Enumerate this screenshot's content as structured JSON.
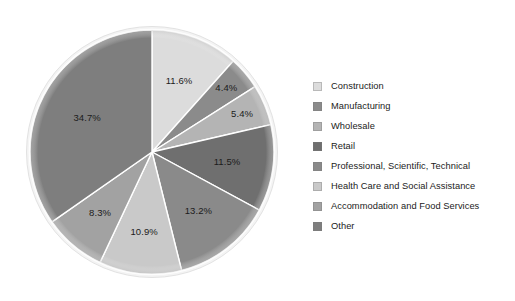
{
  "chart_data": {
    "type": "pie",
    "title": "",
    "subtitle": "",
    "xlabel": "",
    "ylabel": "",
    "legend_position": "right",
    "grid": false,
    "start_angle_oclock": 12,
    "direction": "clockwise",
    "categories": [
      "Construction",
      "Manufacturing",
      "Wholesale",
      "Retail",
      "Professional, Scientific, Technical",
      "Health Care and Social Assistance",
      "Accommodation and Food Services",
      "Other"
    ],
    "values": [
      11.6,
      4.4,
      5.4,
      11.5,
      13.2,
      10.9,
      8.3,
      34.7
    ],
    "value_labels": [
      "11.6%",
      "4.4%",
      "5.4%",
      "11.5%",
      "13.2%",
      "10.9%",
      "8.3%",
      "34.7%"
    ],
    "colors": [
      "#dcdcdc",
      "#8b8b8b",
      "#b4b4b4",
      "#6f6f6f",
      "#8a8a8a",
      "#c9c9c9",
      "#a2a2a2",
      "#7e7e7e"
    ],
    "units": "percent",
    "total": 100.0
  },
  "legend": {
    "items": [
      {
        "label": "Construction",
        "color": "#dcdcdc",
        "value_label": "11.6%"
      },
      {
        "label": "Manufacturing",
        "color": "#8b8b8b",
        "value_label": "4.4%"
      },
      {
        "label": "Wholesale",
        "color": "#b4b4b4",
        "value_label": "5.4%"
      },
      {
        "label": "Retail",
        "color": "#6f6f6f",
        "value_label": "11.5%"
      },
      {
        "label": "Professional, Scientific, Technical",
        "color": "#8a8a8a",
        "value_label": "13.2%"
      },
      {
        "label": "Health Care and Social Assistance",
        "color": "#c9c9c9",
        "value_label": "10.9%"
      },
      {
        "label": "Accommodation and Food Services",
        "color": "#a2a2a2",
        "value_label": "8.3%"
      },
      {
        "label": "Other",
        "color": "#7e7e7e",
        "value_label": "34.7%"
      }
    ]
  },
  "style": {
    "background": "#ffffff",
    "text_color": "#1b1b1b",
    "slice_separator": "#ffffff",
    "rim_color": "#f2f2f2"
  }
}
